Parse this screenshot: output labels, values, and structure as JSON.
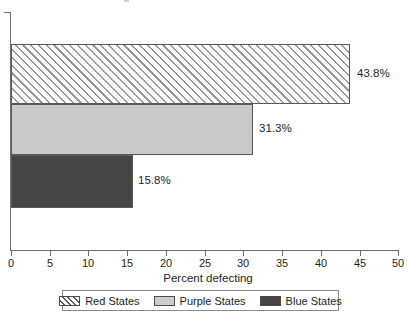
{
  "chart_data": {
    "type": "bar",
    "orientation": "horizontal",
    "title": "",
    "xlabel": "Percent defecting",
    "ylabel": "",
    "xlim": [
      0,
      50
    ],
    "xticks": [
      0,
      5,
      10,
      15,
      20,
      25,
      30,
      35,
      40,
      45,
      50
    ],
    "xtick_labels": [
      "0",
      "5",
      "10",
      "15",
      "20",
      "25",
      "30",
      "35",
      "40",
      "45",
      "50"
    ],
    "grid": false,
    "legend_position": "bottom",
    "categories": [
      "Red States",
      "Purple States",
      "Blue States"
    ],
    "values": [
      43.8,
      31.3,
      15.8
    ],
    "data_labels": [
      "43.8%",
      "31.3%",
      "15.8%"
    ],
    "series": [
      {
        "name": "Red States",
        "value": 43.8,
        "label": "43.8%",
        "fill": "diagonal-hatch",
        "color": "#ffffff",
        "hatch_color": "#9a9a9a"
      },
      {
        "name": "Purple States",
        "value": 31.3,
        "label": "31.3%",
        "fill": "solid",
        "color": "#c9c9c9"
      },
      {
        "name": "Blue States",
        "value": 15.8,
        "label": "15.8%",
        "fill": "solid",
        "color": "#454545"
      }
    ]
  },
  "axis": {
    "x_title": "Percent defecting",
    "ticks": [
      {
        "value": "0"
      },
      {
        "value": "5"
      },
      {
        "value": "10"
      },
      {
        "value": "15"
      },
      {
        "value": "20"
      },
      {
        "value": "25"
      },
      {
        "value": "30"
      },
      {
        "value": "35"
      },
      {
        "value": "40"
      },
      {
        "value": "45"
      },
      {
        "value": "50"
      }
    ]
  },
  "legend": {
    "items": [
      {
        "label": "Red States",
        "swatch": "red-hatch-swatch"
      },
      {
        "label": "Purple States",
        "swatch": "purple-swatch"
      },
      {
        "label": "Blue States",
        "swatch": "blue-swatch"
      }
    ]
  },
  "colors": {
    "axis": "#6f6f6f",
    "text": "#231f20",
    "bar_red_hatch": "#9a9a9a",
    "bar_purple": "#c9c9c9",
    "bar_blue": "#454545",
    "legend_border": "#8a8a8a"
  }
}
